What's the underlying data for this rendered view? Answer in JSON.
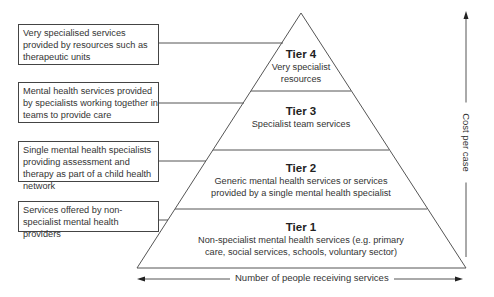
{
  "diagram": {
    "type": "pyramid",
    "tiers": [
      {
        "title": "Tier 4",
        "desc": "Very specialist resources",
        "desc_line1": "Very specialist",
        "desc_line2": "resources"
      },
      {
        "title": "Tier 3",
        "desc": "Specialist team services"
      },
      {
        "title": "Tier 2",
        "desc_line1": "Generic mental health services or services",
        "desc_line2": "provided by a single mental health specialist"
      },
      {
        "title": "Tier 1",
        "desc_line1": "Non-specialist mental health services (e.g. primary",
        "desc_line2": "care, social services, schools, voluntary sector)"
      }
    ],
    "descriptions": [
      "Very specialised services provided by resources such as therapeutic units",
      "Mental health services provided by specialists working together in teams to provide care",
      "Single mental health specialists providing assessment and therapy as part of a child health network",
      "Services offered by non-specialist mental health providers"
    ],
    "x_axis_label": "Number of people receiving services",
    "y_axis_label": "Cost per case",
    "colors": {
      "line": "#555555",
      "text": "#333333",
      "background": "#ffffff"
    }
  }
}
